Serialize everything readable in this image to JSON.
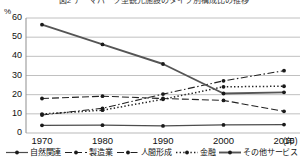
{
  "chart_data": {
    "type": "line",
    "title": "図2 テーマパーク型観光施設のタイプ別構成比の推移",
    "xlabel": "(年)",
    "ylabel": "%",
    "x": [
      1970,
      1980,
      1990,
      2000,
      2010
    ],
    "categories": [
      "1970",
      "1980",
      "1990",
      "2000",
      "2010"
    ],
    "ylim": [
      0,
      60
    ],
    "yticks": [
      0,
      10,
      20,
      30,
      40,
      50,
      60
    ],
    "ytick_labels": [
      "0",
      "10",
      "20",
      "30",
      "40",
      "50",
      "60"
    ],
    "grid": true,
    "legend_position": "bottom",
    "series": [
      {
        "name": "自然関連",
        "style": "solid",
        "color": "#4d4d4d",
        "values": [
          4.0,
          4.1,
          3.7,
          4.2,
          4.4
        ]
      },
      {
        "name": "製造業",
        "style": "dashed",
        "color": "#222222",
        "values": [
          18.0,
          19.2,
          18.0,
          17.0,
          11.3
        ]
      },
      {
        "name": "人間形成",
        "style": "dash-dot",
        "color": "#222222",
        "values": [
          9.4,
          12.9,
          20.3,
          27.2,
          32.5
        ]
      },
      {
        "name": "金融",
        "style": "dotted",
        "color": "#222222",
        "values": [
          9.9,
          11.9,
          17.6,
          24.1,
          24.4
        ]
      },
      {
        "name": "その他サービス",
        "style": "solid-thick",
        "color": "#555555",
        "values": [
          56.5,
          46.2,
          36.0,
          20.6,
          21.2
        ]
      }
    ]
  },
  "axis": {
    "unit_y": "%",
    "unit_x": "(年)"
  }
}
